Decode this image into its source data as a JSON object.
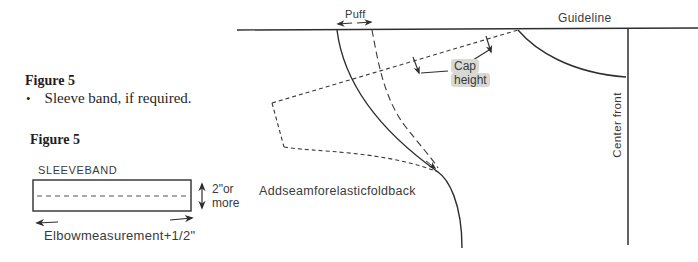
{
  "colors": {
    "ink": "#2e2e2e",
    "highlight": "#d9d9d4",
    "background": "#ffffff"
  },
  "left_panel": {
    "figure_heading_1": "Figure 5",
    "bullet_glyph": "•",
    "bullet_item": "Sleeve band, if required.",
    "figure_heading_2": "Figure 5",
    "band": {
      "label": "SLEEVEBAND",
      "height_note_line1": "2\"or",
      "height_note_line2": "more",
      "width_note": "Elbowmeasurement+1/2\""
    }
  },
  "diagram": {
    "puff_label": "Puff",
    "guideline_label": "Guideline",
    "cap_height_line1": "Cap",
    "cap_height_line2": "height",
    "center_front_label": "Center front",
    "seam_note": "Addseamforelasticfoldback"
  }
}
